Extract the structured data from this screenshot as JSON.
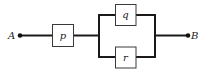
{
  "diagram": {
    "type": "switching-circuit",
    "terminals": [
      {
        "id": "A",
        "label": "A"
      },
      {
        "id": "B",
        "label": "B"
      }
    ],
    "components": [
      {
        "id": "p",
        "label": "p",
        "position": "series"
      },
      {
        "id": "q",
        "label": "q",
        "position": "parallel-top"
      },
      {
        "id": "r",
        "label": "r",
        "position": "parallel-bottom"
      }
    ],
    "colors": {
      "line": "#1a1a1a",
      "box_border": "#3a3a3a",
      "background": "#ffffff"
    }
  }
}
